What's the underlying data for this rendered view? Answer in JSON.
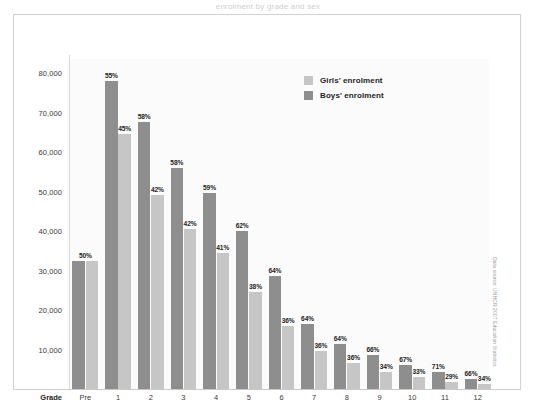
{
  "page": {
    "top_caption": "enrolment by grade and sex"
  },
  "legend": {
    "position": "top-right",
    "items": [
      {
        "label": "Girls' enrolment",
        "color": "#c6c6c6",
        "series": "girls"
      },
      {
        "label": "Boys' enrolment",
        "color": "#8e8e8e",
        "series": "boys"
      }
    ]
  },
  "axes": {
    "x_axis_title": "Grade",
    "y_ticks": [
      "10,000",
      "20,000",
      "30,000",
      "40,000",
      "50,000",
      "60,000",
      "70,000",
      "80,000"
    ]
  },
  "source_note": "Data source: UNHCR 2007 Education Statistics",
  "chart_data": {
    "type": "bar",
    "title": "enrolment by grade and sex",
    "xlabel": "Grade",
    "ylabel": "",
    "ylim": [
      0,
      85000
    ],
    "ytick_values": [
      10000,
      20000,
      30000,
      40000,
      50000,
      60000,
      70000,
      80000
    ],
    "grid": false,
    "legend_position": "top-right",
    "categories": [
      "Pre",
      "1",
      "2",
      "3",
      "4",
      "5",
      "6",
      "7",
      "8",
      "9",
      "10",
      "11",
      "12"
    ],
    "series": [
      {
        "name": "Boys' enrolment",
        "color": "#8e8e8e",
        "values": [
          32500,
          78000,
          67500,
          56000,
          49500,
          40000,
          28500,
          16500,
          11500,
          8500,
          6000,
          4200,
          2500
        ],
        "pct_labels": [
          "50%",
          "55%",
          "58%",
          "58%",
          "59%",
          "62%",
          "64%",
          "64%",
          "64%",
          "66%",
          "67%",
          "71%",
          "66%"
        ]
      },
      {
        "name": "Girls' enrolment",
        "color": "#c6c6c6",
        "values": [
          32500,
          64500,
          49000,
          40500,
          34500,
          24500,
          16000,
          9500,
          6500,
          4400,
          3000,
          1800,
          1300
        ],
        "pct_labels": [
          "",
          "45%",
          "42%",
          "42%",
          "41%",
          "38%",
          "36%",
          "36%",
          "36%",
          "34%",
          "33%",
          "29%",
          "34%"
        ]
      }
    ]
  }
}
